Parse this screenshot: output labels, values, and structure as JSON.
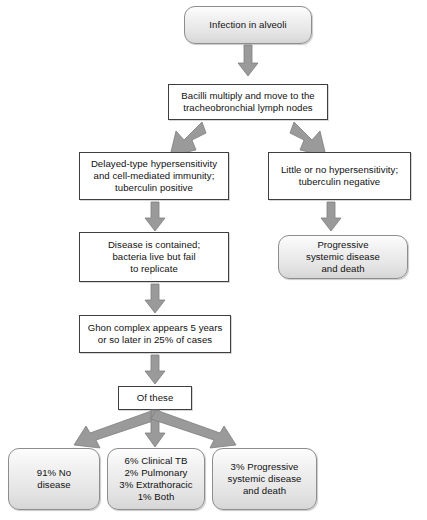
{
  "diagram": {
    "colors": {
      "arrow_fill": "#9a9a9a",
      "arrow_stroke": "#6f6f6f",
      "rect_border": "#3f3f3f",
      "round_border": "#8d8d8d",
      "round_fill_top": "#fdfdfd",
      "round_fill_bottom": "#d6d6d6",
      "text": "#111111",
      "background": "#ffffff"
    },
    "nodes": [
      {
        "id": "infection-in-alveoli",
        "shape": "rounded",
        "text": "Infection in alveoli"
      },
      {
        "id": "bacilli-multiply",
        "shape": "rect",
        "text": "Bacilli multiply and move to the\ntracheobronchial lymph nodes"
      },
      {
        "id": "delayed-type-hypersensitivity",
        "shape": "rect",
        "text": "Delayed-type hypersensitivity\nand cell-mediated immunity;\ntuberculin positive"
      },
      {
        "id": "little-or-no-hypersensitivity",
        "shape": "rect",
        "text": "Little or no hypersensitivity;\ntuberculin negative"
      },
      {
        "id": "disease-is-contained",
        "shape": "rect",
        "text": "Disease is contained;\nbacteria live but fail\nto replicate"
      },
      {
        "id": "progressive-systemic-disease",
        "shape": "rounded",
        "text": "Progressive\nsystemic disease\nand death"
      },
      {
        "id": "ghon-complex",
        "shape": "rect",
        "text": "Ghon complex appears 5 years\nor so later in 25% of cases"
      },
      {
        "id": "of-these",
        "shape": "rect",
        "text": "Of these"
      },
      {
        "id": "no-disease-outcome",
        "shape": "rounded",
        "text": "91% No\ndisease"
      },
      {
        "id": "clinical-tb-outcome",
        "shape": "rounded",
        "text": "6% Clinical TB\n2% Pulmonary\n3% Extrathoracic\n1% Both"
      },
      {
        "id": "progressive-outcome",
        "shape": "rounded",
        "text": "3% Progressive\nsystemic disease\nand death"
      }
    ],
    "edges": [
      {
        "id": "edge-alveoli-to-bacilli",
        "from": "infection-in-alveoli",
        "to": "bacilli-multiply",
        "direction": "down"
      },
      {
        "id": "edge-bacilli-to-delayed",
        "from": "bacilli-multiply",
        "to": "delayed-type-hypersensitivity",
        "direction": "down-left"
      },
      {
        "id": "edge-bacilli-to-little",
        "from": "bacilli-multiply",
        "to": "little-or-no-hypersensitivity",
        "direction": "down-right"
      },
      {
        "id": "edge-delayed-to-contained",
        "from": "delayed-type-hypersensitivity",
        "to": "disease-is-contained",
        "direction": "down"
      },
      {
        "id": "edge-little-to-progressive",
        "from": "little-or-no-hypersensitivity",
        "to": "progressive-systemic-disease",
        "direction": "down"
      },
      {
        "id": "edge-contained-to-ghon",
        "from": "disease-is-contained",
        "to": "ghon-complex",
        "direction": "down"
      },
      {
        "id": "edge-ghon-to-ofthese",
        "from": "ghon-complex",
        "to": "of-these",
        "direction": "down"
      },
      {
        "id": "edge-ofthese-to-nodisease",
        "from": "of-these",
        "to": "no-disease-outcome",
        "direction": "down-left"
      },
      {
        "id": "edge-ofthese-to-clinicaltb",
        "from": "of-these",
        "to": "clinical-tb-outcome",
        "direction": "down"
      },
      {
        "id": "edge-ofthese-to-progressive",
        "from": "of-these",
        "to": "progressive-outcome",
        "direction": "down-right"
      }
    ]
  }
}
